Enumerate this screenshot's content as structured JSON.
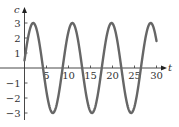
{
  "chart_data": {
    "type": "line",
    "title": "",
    "xlabel": "t",
    "ylabel": "c",
    "xlim": [
      0,
      31
    ],
    "ylim": [
      -3.4,
      3.6
    ],
    "grid": false,
    "legend": null,
    "x_ticks": [
      5,
      10,
      15,
      20,
      25,
      30
    ],
    "y_ticks": [
      -3,
      -2,
      -1,
      1,
      2,
      3
    ],
    "x_tick_labels": [
      "5",
      "10",
      "15",
      "20",
      "25",
      "30"
    ],
    "y_tick_labels": [
      "−3",
      "−2",
      "−1",
      "1",
      "2",
      "3"
    ],
    "series": [
      {
        "name": "c(t)",
        "color": "#666666",
        "function": "c = 3 sin(2πt/8.9 + 0.17)",
        "x": [
          0,
          1,
          2,
          2.7,
          3,
          4,
          5,
          6,
          6.8,
          7,
          8,
          9,
          10,
          11,
          11.6,
          12,
          13,
          14,
          15,
          15.6,
          16,
          17,
          18,
          19,
          20,
          20.3,
          21,
          22,
          23,
          24,
          24.7,
          25,
          26,
          27,
          28,
          29,
          29.2,
          30
        ],
        "values": [
          0.5,
          2.0,
          2.9,
          3.0,
          2.9,
          2.0,
          0.6,
          -1.1,
          -2.0,
          -2.9,
          -2.6,
          -1.3,
          0.3,
          1.8,
          3.0,
          2.9,
          2.3,
          0.9,
          -0.8,
          -3.0,
          -2.9,
          -2.7,
          -1.6,
          0.1,
          1.6,
          3.0,
          2.9,
          2.5,
          1.2,
          -0.5,
          -3.0,
          -2.9,
          -2.9,
          -1.9,
          -0.3,
          1.3,
          3.0,
          1.5
        ]
      }
    ]
  },
  "axes": {
    "x_label": "t",
    "y_label": "c",
    "x_ticks": [
      "5",
      "10",
      "15",
      "20",
      "25",
      "30"
    ],
    "y_ticks_pos": [
      "1",
      "2",
      "3"
    ],
    "y_ticks_neg": [
      "−1",
      "−2",
      "−3"
    ]
  }
}
